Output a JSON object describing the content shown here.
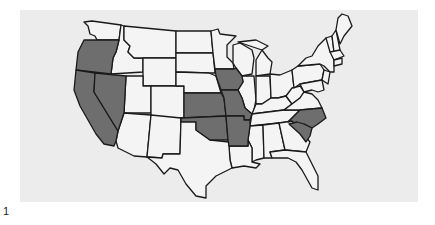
{
  "figure": {
    "label": "1",
    "title": "",
    "colors": {
      "background_panel": "#ececec",
      "unshaded": "#f4f4f4",
      "shaded": "#6e6e6e",
      "border": "#1a1a1a"
    }
  },
  "map": {
    "region": "Contiguous United States",
    "shaded_states": [
      "Oregon",
      "California",
      "Nevada",
      "Iowa",
      "Kansas",
      "Missouri",
      "Oklahoma",
      "Arkansas",
      "North Carolina",
      "South Carolina"
    ],
    "legend": []
  }
}
